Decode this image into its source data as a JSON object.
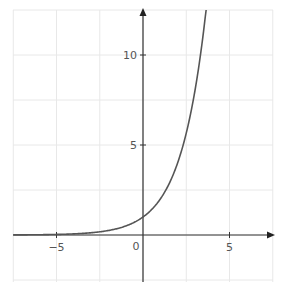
{
  "chart_data": {
    "type": "line",
    "title": "",
    "function": "y = 2^x",
    "xlabel": "",
    "ylabel": "",
    "xlim": [
      -7.5,
      7.5
    ],
    "ylim": [
      -2.5,
      12.5
    ],
    "grid": true,
    "grid_step": 2.5,
    "x_ticks": [
      -5,
      5
    ],
    "x_tick_labels": [
      "−5",
      "5"
    ],
    "y_ticks": [
      5,
      10
    ],
    "y_tick_labels": [
      "5",
      "10"
    ],
    "origin_label": "0",
    "series": [
      {
        "name": "y = 2^x",
        "color": "#555555",
        "x": [
          -7.5,
          -5,
          -2.5,
          -1,
          0,
          1,
          2,
          2.5,
          3,
          3.5,
          3.64
        ],
        "y": [
          0.006,
          0.031,
          0.177,
          0.5,
          1,
          2,
          4,
          5.66,
          8,
          11.31,
          12.5
        ]
      }
    ]
  },
  "colors": {
    "grid": "#e8e8e8",
    "axis": "#333333",
    "curve": "#555555",
    "label": "#555555"
  }
}
